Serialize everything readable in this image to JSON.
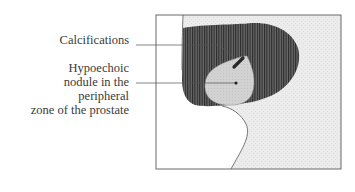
{
  "figure": {
    "type": "schematic ultrasound illustration",
    "labels": {
      "calcifications": "Calcifications",
      "nodule_lines": [
        "Hypoechoic",
        "nodule in the",
        "peripheral",
        "zone of the prostate"
      ]
    },
    "colors": {
      "background": "#ffffff",
      "frame": "#6a6a6a",
      "stipple_region": "#ebebeb",
      "hatched_region": "#555555",
      "hatch_lines": "#2a2a2a",
      "nodule": "#cfcfcf",
      "calcification": "#2a2a2a",
      "leader_lines": "#555555",
      "text": "#3a3a3a"
    }
  }
}
